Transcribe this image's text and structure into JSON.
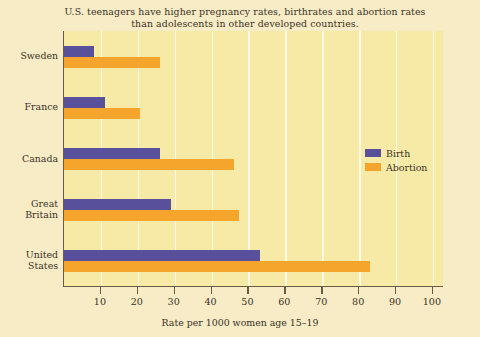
{
  "chart_data": {
    "type": "bar",
    "orientation": "horizontal",
    "title": "U.S. teenagers have higher pregnancy rates, birthrates and abortion rates than adolescents in other developed countries.",
    "title_lines": [
      "U.S. teenagers have higher pregnancy rates, birthrates and abortion rates",
      "than adolescents in other developed countries."
    ],
    "categories": [
      "Sweden",
      "France",
      "Canada",
      "Great Britain",
      "United States"
    ],
    "category_lines": [
      [
        "Sweden"
      ],
      [
        "France"
      ],
      [
        "Canada"
      ],
      [
        "Great",
        "Britain"
      ],
      [
        "United",
        "States"
      ]
    ],
    "series": [
      {
        "name": "Birth",
        "color": "#58509b",
        "values": [
          8,
          11,
          26,
          29,
          53
        ]
      },
      {
        "name": "Abortion",
        "color": "#f5a52c",
        "values": [
          26,
          20.5,
          46,
          47.5,
          83
        ]
      }
    ],
    "xlabel": "Rate per 1000 women age 15–19",
    "ylabel": "",
    "xlim": [
      0,
      103
    ],
    "xticks": [
      10,
      20,
      30,
      40,
      50,
      60,
      70,
      80,
      90,
      100
    ],
    "xtick_labels": [
      "10",
      "20",
      "30",
      "40",
      "50",
      "60",
      "70",
      "80",
      "90",
      "100"
    ],
    "grid": "vertical",
    "gridline_color": "#fdfbe6",
    "legend_position": "center-right",
    "plot_background": "#f7eaa6",
    "page_background": "#f7ecc6",
    "axis_color": "#6b5b45",
    "text_color": "#3b3225"
  },
  "legend": {
    "entries": [
      {
        "label": "Birth",
        "color": "#58509b"
      },
      {
        "label": "Abortion",
        "color": "#f5a52c"
      }
    ]
  }
}
